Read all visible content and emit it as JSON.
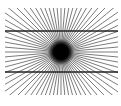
{
  "figure": {
    "name": "Hering illusion",
    "center": [
      61,
      52
    ],
    "ray_count": 72,
    "ray_color": "#444444",
    "clip": {
      "x": 5,
      "y": 8,
      "width": 113,
      "height": 87
    },
    "center_blob": {
      "radius": 9,
      "color": "#000000"
    },
    "horizontal_lines": [
      {
        "y": 31,
        "x1": 5,
        "x2": 118,
        "color": "#222222"
      },
      {
        "y": 72,
        "x1": 5,
        "x2": 118,
        "color": "#222222"
      }
    ]
  },
  "caption": ""
}
